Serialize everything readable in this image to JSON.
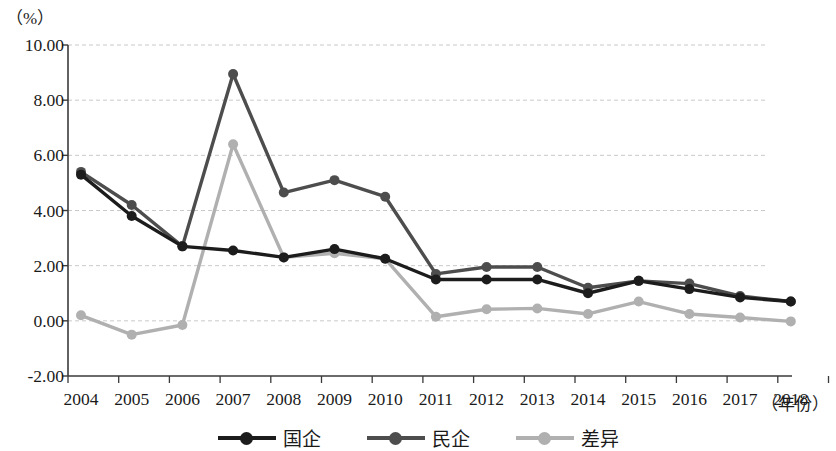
{
  "chart_data": {
    "type": "line",
    "title": "",
    "subtitle": "",
    "ylabel": "（%）",
    "xlabel": "（年份）",
    "categories": [
      "2004",
      "2005",
      "2006",
      "2007",
      "2008",
      "2009",
      "2010",
      "2011",
      "2012",
      "2013",
      "2014",
      "2015",
      "2016",
      "2017",
      "2018"
    ],
    "ylim": [
      -2.0,
      10.0
    ],
    "yticks": [
      "-2.00",
      "0.00",
      "2.00",
      "4.00",
      "6.00",
      "8.00",
      "10.00"
    ],
    "ytick_values": [
      -2.0,
      0.0,
      2.0,
      4.0,
      6.0,
      8.0,
      10.0
    ],
    "grid": true,
    "grid_style": "dashed-horizontal",
    "legend_position": "bottom-center",
    "series": [
      {
        "name": "国企",
        "color": "#1c1c1c",
        "values": [
          5.3,
          3.8,
          2.7,
          2.55,
          2.3,
          2.6,
          2.25,
          1.5,
          1.5,
          1.5,
          1.0,
          1.45,
          1.15,
          0.85,
          0.7
        ]
      },
      {
        "name": "民企",
        "color": "#4d4d4d",
        "values": [
          5.4,
          4.2,
          2.7,
          8.95,
          4.65,
          5.1,
          4.5,
          1.7,
          1.95,
          1.95,
          1.2,
          1.45,
          1.35,
          0.9,
          0.7
        ]
      },
      {
        "name": "差异",
        "color": "#b0b0b0",
        "values": [
          0.2,
          -0.5,
          -0.15,
          6.4,
          2.3,
          2.45,
          2.25,
          0.15,
          0.42,
          0.45,
          0.25,
          0.7,
          0.25,
          0.12,
          -0.02
        ]
      }
    ]
  },
  "axes": {
    "y_unit": "（%）",
    "x_unit": "（年份）"
  },
  "legend": {
    "items": [
      {
        "label": "国企",
        "color": "#1c1c1c",
        "swatch": "line-marker-swatch"
      },
      {
        "label": "民企",
        "color": "#4d4d4d",
        "swatch": "line-marker-swatch"
      },
      {
        "label": "差异",
        "color": "#b0b0b0",
        "swatch": "line-marker-swatch"
      }
    ]
  }
}
